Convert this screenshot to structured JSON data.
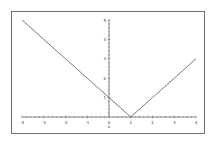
{
  "chart_data": {
    "type": "line",
    "title": "",
    "function": "y = |x - 1|",
    "xlabel": "x",
    "ylabel": "",
    "xlim": [
      -4,
      4
    ],
    "ylim": [
      0,
      5
    ],
    "grid": false,
    "legend": null,
    "x_ticks": [
      "-4",
      "-3",
      "-2",
      "-1",
      "0",
      "1",
      "2",
      "3",
      "4"
    ],
    "y_ticks": [
      "1",
      "2",
      "3",
      "4",
      "5"
    ],
    "series": [
      {
        "name": "|x-1|",
        "x": [
          -4,
          -3,
          -2,
          -1,
          0,
          1,
          2,
          3,
          4
        ],
        "values": [
          5,
          4,
          3,
          2,
          1,
          0,
          1,
          2,
          3
        ]
      }
    ]
  },
  "colors": {
    "frame": "#707070",
    "axis": "#555555",
    "line": "#6a6a6a"
  }
}
